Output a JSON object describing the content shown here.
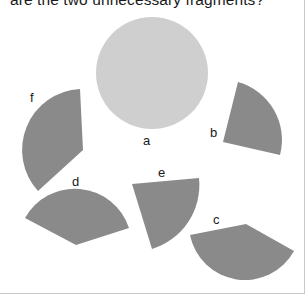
{
  "question": {
    "text": "are the two unnecessary fragments?"
  },
  "colors": {
    "circle": "#cfcfcf",
    "fragment": "#8a8a8a",
    "text": "#1a1a1a",
    "border": "#c8c8c8"
  },
  "figure": {
    "circle": {
      "label": "a"
    },
    "fragments": [
      {
        "label": "b"
      },
      {
        "label": "c"
      },
      {
        "label": "d"
      },
      {
        "label": "e"
      },
      {
        "label": "f"
      }
    ]
  }
}
